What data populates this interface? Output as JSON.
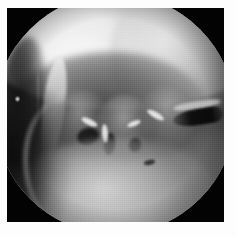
{
  "figure": {
    "domain": "natural-image",
    "kind": "grayscale-endoscopic-photograph",
    "modality": "arthroscopy / endoscopy still frame",
    "title": "",
    "caption": "",
    "colorspace": "grayscale",
    "width_px": 236,
    "height_px": 237
  },
  "frame": {
    "page_background": "#fdfdfd",
    "margin_left_px": 7,
    "margin_top_px": 8,
    "margin_right_px": 12,
    "margin_bottom_px": 15,
    "plate_width_px": 217,
    "plate_height_px": 214,
    "letterbox_color": "#030303"
  },
  "aperture": {
    "shape": "circle",
    "label": "endoscope circular field of view",
    "diameter_px": 240,
    "center_x_px": 108,
    "center_y_px": 106,
    "vignette": "heavy black falloff at rim"
  },
  "regions": [
    {
      "id": "top-glare",
      "label": "illuminated upper tissue band",
      "tone": "#f8f8f8",
      "description": "specular light-source glare across the upper third"
    },
    {
      "id": "upper-right-sheet",
      "label": "upper right tissue sheet",
      "tone": "#d8d8d8",
      "description": "secondary bright sheet on the right superior wall"
    },
    {
      "id": "cavity-shadow",
      "label": "shadowed recess",
      "tone": "#3a3a3a",
      "description": "deep shadowed cavity beneath the glare band"
    },
    {
      "id": "left-cleft",
      "label": "left dark cleft",
      "tone": "#141414",
      "description": "narrow dark recess at the far left of the lumen"
    },
    {
      "id": "septum-ridge",
      "label": "bright septal ridge",
      "tone": "#ececec",
      "description": "vertical bright ridge dividing the left chamber"
    },
    {
      "id": "lobe-a",
      "label": "villous lobule left",
      "tone": "#a8a8a8"
    },
    {
      "id": "lobe-b",
      "label": "villous lobule centre",
      "tone": "#b2b2b2"
    },
    {
      "id": "lobe-c",
      "label": "villous lobule right",
      "tone": "#acacac"
    },
    {
      "id": "right-fissure",
      "label": "dark horizontal fissure on right wall",
      "tone": "#080808"
    },
    {
      "id": "lower-shelf",
      "label": "bright tissue floor shelf",
      "tone": "#c8c8c8"
    },
    {
      "id": "left-crescent",
      "label": "dark crescent shadow at left",
      "tone": "#0e0e0e"
    },
    {
      "id": "floor-fleck",
      "label": "small dark fleck on floor",
      "tone": "#1a1a1a"
    }
  ],
  "artifacts": [
    {
      "id": "speck",
      "label": "bright speck artifact outside aperture",
      "x_px": 15,
      "y_px": 97,
      "tone": "#f6f6f6"
    },
    {
      "id": "scratch",
      "label": "faint vertical scratch outside aperture",
      "x_px": 37,
      "y_px": 66,
      "tone": "#a8a8a8"
    }
  ],
  "palette": {
    "highlight": "#f8f8f8",
    "light_tissue": "#c8c8c8",
    "mid_tissue": "#8f8f8f",
    "dark_tissue": "#4a4a4a",
    "shadow": "#1a1a1a",
    "background_black": "#030303",
    "page_white": "#fdfdfd"
  }
}
